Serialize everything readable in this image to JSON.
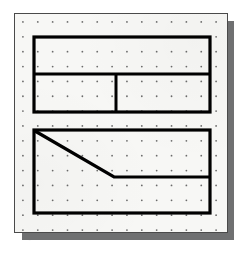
{
  "figure": {
    "kind": "geoboard-dot-grid-worksheet",
    "caption": "",
    "board": {
      "background_color": "#f7f7f5",
      "border_color": "#4a4a4a",
      "shadow_color": "#6f7071",
      "x": 14,
      "y": 13,
      "width": 214,
      "height": 220
    },
    "grid": {
      "name": "dot-grid",
      "dot_color": "#6b6b6b",
      "dot_radius": 0.9,
      "spacing_x": 15,
      "spacing_y": 15,
      "origin_x": 8,
      "origin_y": 8,
      "columns": 14,
      "rows": 15
    },
    "stroke": {
      "color": "#000000",
      "outline_width": 3.2,
      "divider_width": 3.0,
      "diagonal_width": 3.2
    },
    "shapes": [
      {
        "name": "upper-rectangle",
        "type": "rectangle",
        "x": 19,
        "y": 23,
        "width": 176,
        "height": 75,
        "fill": "none"
      },
      {
        "name": "upper-horizontal-divider",
        "type": "line",
        "x1": 19,
        "y1": 60,
        "x2": 195,
        "y2": 60
      },
      {
        "name": "upper-vertical-divider",
        "type": "line",
        "x1": 101,
        "y1": 60,
        "x2": 101,
        "y2": 98
      },
      {
        "name": "lower-rectangle",
        "type": "rectangle",
        "x": 19,
        "y": 116,
        "width": 176,
        "height": 83,
        "fill": "none"
      },
      {
        "name": "lower-diagonal-segment",
        "type": "line",
        "x1": 20,
        "y1": 117,
        "x2": 99,
        "y2": 163
      },
      {
        "name": "lower-horizontal-segment",
        "type": "line",
        "x1": 99,
        "y1": 163,
        "x2": 195,
        "y2": 163
      }
    ],
    "regions": [
      {
        "name": "upper-top-band",
        "label": ""
      },
      {
        "name": "upper-bottom-left-cell",
        "label": ""
      },
      {
        "name": "upper-bottom-right-cell",
        "label": ""
      },
      {
        "name": "lower-upper-region",
        "label": ""
      },
      {
        "name": "lower-lower-region",
        "label": ""
      }
    ]
  }
}
